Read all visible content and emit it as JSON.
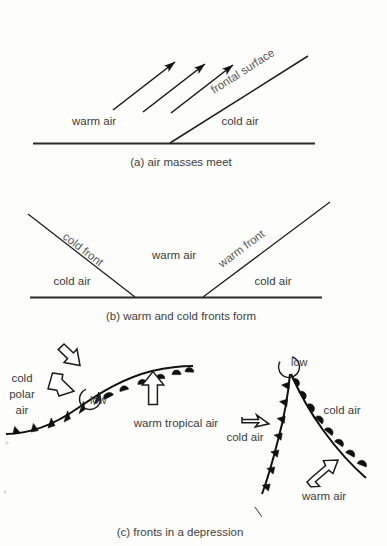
{
  "figure": {
    "title_implied": "Formation of fronts and a depression",
    "background_color": "#fdfdfc",
    "ink_color": "#1b1b1b",
    "text_color": "#3a3a3a",
    "width": 387,
    "height": 546
  },
  "panel_a": {
    "caption": "(a) air masses meet",
    "labels": {
      "warm_air": "warm air",
      "cold_air": "cold air",
      "frontal_surface": "frontal surface"
    },
    "arrow_count": 3,
    "arrow_meaning": "warm air rising over the frontal surface",
    "ground_line": "horizontal surface"
  },
  "panel_b": {
    "caption": "(b) warm and cold fronts form",
    "labels": {
      "cold_front": "cold front",
      "warm_front": "warm front",
      "warm_air": "warm air",
      "cold_air_left": "cold air",
      "cold_air_right": "cold air"
    },
    "shape": "V-shaped warm sector between cold front (left, descending) and warm front (right, ascending)"
  },
  "panel_c": {
    "caption": "(c) fronts in a depression",
    "left_map": {
      "labels": {
        "cold_polar_air": [
          "cold",
          "polar",
          "air"
        ],
        "warm_tropical_air": "warm tropical air",
        "low": "low"
      },
      "front_symbols": {
        "cold_front": "filled triangles",
        "warm_front": "filled semicircles"
      },
      "arrows": [
        {
          "name": "cold-air-arrow-upper",
          "direction": "down-right",
          "style": "hollow"
        },
        {
          "name": "cold-air-arrow-lower",
          "direction": "down",
          "style": "hollow"
        },
        {
          "name": "warm-air-arrow",
          "direction": "up",
          "style": "hollow"
        }
      ]
    },
    "right_map": {
      "labels": {
        "low": "low",
        "cold_air_left": "cold air",
        "cold_air_right": "cold air",
        "warm_air": "warm air"
      },
      "front_symbols": {
        "cold_front": "filled triangles",
        "warm_front": "filled semicircles"
      },
      "arrows": [
        {
          "name": "cold-air-arrow",
          "direction": "right",
          "style": "hollow"
        },
        {
          "name": "warm-air-arrow",
          "direction": "up-right",
          "style": "hollow"
        }
      ]
    }
  }
}
